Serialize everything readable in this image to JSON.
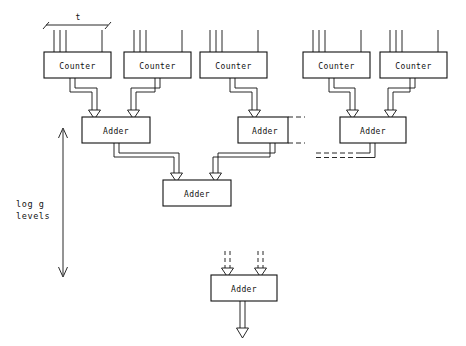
{
  "figure": {
    "background_color": "#ffffff",
    "line_color": "#111111",
    "width": 466,
    "height": 346
  },
  "labels": {
    "counter": "Counter",
    "adder": "Adder",
    "t_dimension": "t",
    "levels_line1": "log g",
    "levels_line2": "levels"
  },
  "counters": [
    {
      "id": "counter-1",
      "label": "Counter",
      "x": 44,
      "y": 52,
      "w": 67,
      "h": 26
    },
    {
      "id": "counter-2",
      "label": "Counter",
      "x": 124,
      "y": 52,
      "w": 67,
      "h": 26
    },
    {
      "id": "counter-3",
      "label": "Counter",
      "x": 200,
      "y": 52,
      "w": 67,
      "h": 26
    },
    {
      "id": "counter-4",
      "label": "Counter",
      "x": 303,
      "y": 52,
      "w": 67,
      "h": 26
    },
    {
      "id": "counter-5",
      "label": "Counter",
      "x": 380,
      "y": 52,
      "w": 67,
      "h": 26
    }
  ],
  "adders": [
    {
      "id": "adder-l1-a",
      "label": "Adder",
      "x": 82,
      "y": 117,
      "w": 68,
      "h": 26,
      "level": 1
    },
    {
      "id": "adder-l1-b",
      "label": "Adder",
      "x": 238,
      "y": 117,
      "w": 50,
      "h": 26,
      "level": 1
    },
    {
      "id": "adder-l1-c",
      "label": "Adder",
      "x": 340,
      "y": 117,
      "w": 66,
      "h": 26,
      "level": 1
    },
    {
      "id": "adder-l2",
      "label": "Adder",
      "x": 163,
      "y": 180,
      "w": 68,
      "h": 26,
      "level": 2
    },
    {
      "id": "adder-final",
      "label": "Adder",
      "x": 211,
      "y": 275,
      "w": 66,
      "h": 26,
      "level": "final"
    }
  ],
  "level_indicator": {
    "label_line1": "log g",
    "label_line2": "levels",
    "label_x": 16,
    "label_y1": 205,
    "label_y2": 216,
    "arrow_x": 63,
    "arrow_top": 128,
    "arrow_bottom": 275
  },
  "t_bracket": {
    "label": "t",
    "label_x": 78,
    "label_y": 20,
    "left_x": 46,
    "right_x": 108,
    "y": 25
  },
  "counter_inputs": {
    "description": "each counter has three closely spaced input lines plus one separated line at the right",
    "close_line_offsets": [
      10,
      16,
      22
    ],
    "far_line_offset": 58,
    "top_y": 30,
    "bottom_y": 52
  },
  "dashed_continuations": [
    {
      "id": "dash-adder-b-top",
      "x1": 288,
      "y1": 117,
      "x2": 303,
      "y2": 117
    },
    {
      "id": "dash-adder-b-bottom",
      "x1": 288,
      "y1": 143,
      "x2": 303,
      "y2": 143
    },
    {
      "id": "dash-adder-c-out-a",
      "x1": 318,
      "y1": 153,
      "x2": 358,
      "y2": 153
    },
    {
      "id": "dash-adder-c-out-b",
      "x1": 318,
      "y1": 157,
      "x2": 358,
      "y2": 157
    }
  ],
  "final_adder_inputs": [
    {
      "id": "final-input-left",
      "x": 228,
      "style": "dashed"
    },
    {
      "id": "final-input-right",
      "x": 261,
      "style": "dashed"
    }
  ],
  "final_adder_output": {
    "id": "final-output",
    "x": 244,
    "style": "solid",
    "y_start": 301,
    "y_end": 336
  }
}
